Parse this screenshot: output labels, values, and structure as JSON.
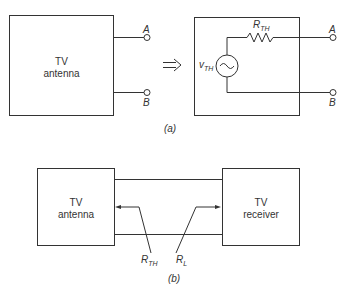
{
  "figure_a": {
    "caption": "(a)",
    "antenna_label_1": "TV",
    "antenna_label_2": "antenna",
    "terminal_a": "A",
    "terminal_b": "B",
    "implies_symbol": "⇒",
    "resistor_label": "R",
    "resistor_sub": "TH",
    "source_label": "v",
    "source_sub": "TH"
  },
  "figure_b": {
    "caption": "(b)",
    "antenna_label_1": "TV",
    "antenna_label_2": "antenna",
    "receiver_label_1": "TV",
    "receiver_label_2": "receiver",
    "rth_label": "R",
    "rth_sub": "TH",
    "rl_label": "R",
    "rl_sub": "L"
  }
}
